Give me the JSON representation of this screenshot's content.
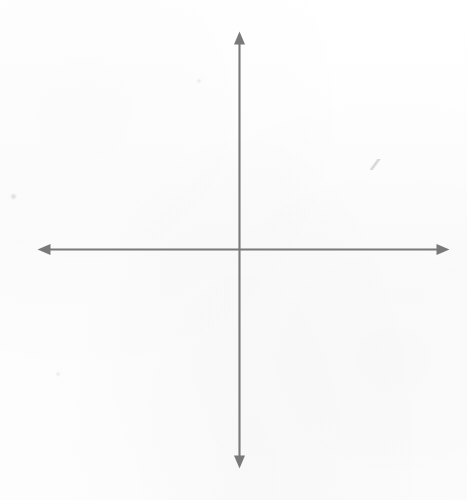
{
  "document": {
    "title": "Blank Cartesian coordinate axes",
    "kind": "hand-drawn scanned figure",
    "width": 467,
    "height": 500,
    "background_color": "#fdfdfd"
  },
  "chart_data": {
    "type": "scatter",
    "title": "",
    "subtitle": "",
    "xlabel": "",
    "ylabel": "",
    "x": [],
    "y": [],
    "series": [],
    "categories": [],
    "values": [],
    "annotations": [],
    "legend": [],
    "legend_position": "none",
    "grid": false,
    "tick_labels_x": [],
    "tick_labels_y": [],
    "xlim": [
      -1,
      1
    ],
    "ylim": [
      -1,
      1
    ]
  },
  "figure": {
    "stroke_color": "#797979",
    "stroke_width": 2,
    "origin": {
      "x": 239,
      "y": 249
    },
    "x_axis": {
      "name": "horizontal-axis",
      "start_x": 38,
      "end_x": 449,
      "y": 249,
      "arrow_left": true,
      "arrow_right": true,
      "label": ""
    },
    "y_axis": {
      "name": "vertical-axis",
      "start_y": 32,
      "end_y": 468,
      "x": 239,
      "arrow_up": true,
      "arrow_down": true,
      "label": ""
    },
    "arrowhead": {
      "length": 13,
      "half_width": 5.5
    },
    "quadrants": [
      {
        "name": "quadrant-I",
        "sign_x": "+",
        "sign_y": "+"
      },
      {
        "name": "quadrant-II",
        "sign_x": "-",
        "sign_y": "+"
      },
      {
        "name": "quadrant-III",
        "sign_x": "-",
        "sign_y": "-"
      },
      {
        "name": "quadrant-IV",
        "sign_x": "+",
        "sign_y": "-"
      }
    ]
  },
  "artifacts": [
    {
      "name": "pencil-smudge-right",
      "x": 375,
      "y": 164
    },
    {
      "name": "pencil-speck-left",
      "x": 13,
      "y": 196
    },
    {
      "name": "pencil-speck-lower",
      "x": 58,
      "y": 374
    },
    {
      "name": "pencil-speck-upper",
      "x": 199,
      "y": 81
    }
  ]
}
